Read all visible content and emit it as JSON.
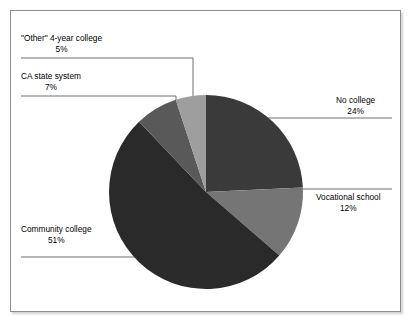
{
  "chart_data": {
    "type": "pie",
    "title": "",
    "subtitle": "",
    "xlabel": "",
    "ylabel": "",
    "grid": false,
    "legend_position": "none",
    "label_style": "callout-with-leader-lines",
    "start_angle_deg": 0,
    "direction": "clockwise",
    "total": 99,
    "units": "percent",
    "categories": [
      "No college",
      "Vocational school",
      "Community college",
      "CA state system",
      "\"Other\" 4-year college"
    ],
    "values": [
      24,
      12,
      51,
      7,
      5
    ],
    "value_labels": [
      "24%",
      "12%",
      "51%",
      "7%",
      "5%"
    ],
    "colors": [
      "#3a3a3a",
      "#757575",
      "#2a2a2a",
      "#595959",
      "#9e9e9e"
    ],
    "slices": [
      {
        "name": "No college",
        "value": 24,
        "value_label": "24%",
        "color": "#3a3a3a",
        "start_deg": 0,
        "end_deg": 86.4,
        "label_side": "right"
      },
      {
        "name": "Vocational school",
        "value": 12,
        "value_label": "12%",
        "color": "#757575",
        "start_deg": 86.4,
        "end_deg": 129.6,
        "label_side": "right"
      },
      {
        "name": "Community college",
        "value": 51,
        "value_label": "51%",
        "color": "#2a2a2a",
        "start_deg": 129.6,
        "end_deg": 313.2,
        "label_side": "left"
      },
      {
        "name": "CA state system",
        "value": 7,
        "value_label": "7%",
        "color": "#595959",
        "start_deg": 313.2,
        "end_deg": 338.4,
        "label_side": "left"
      },
      {
        "name": "\"Other\" 4-year college",
        "value": 5,
        "value_label": "5%",
        "color": "#9e9e9e",
        "start_deg": 338.4,
        "end_deg": 360,
        "label_side": "left"
      }
    ]
  },
  "labels": {
    "other": {
      "title": "\"Other\" 4-year college",
      "value": "5%"
    },
    "castate": {
      "title": "CA state system",
      "value": "7%"
    },
    "community": {
      "title": "Community college",
      "value": "51%"
    },
    "nocollege": {
      "title": "No college",
      "value": "24%"
    },
    "vocational": {
      "title": "Vocational school",
      "value": "12%"
    }
  },
  "style": {
    "frame_border_color": "#8e8e8e",
    "leader_line_color": "#6e6e6e",
    "background": "#ffffff",
    "text_color": "#000000"
  }
}
